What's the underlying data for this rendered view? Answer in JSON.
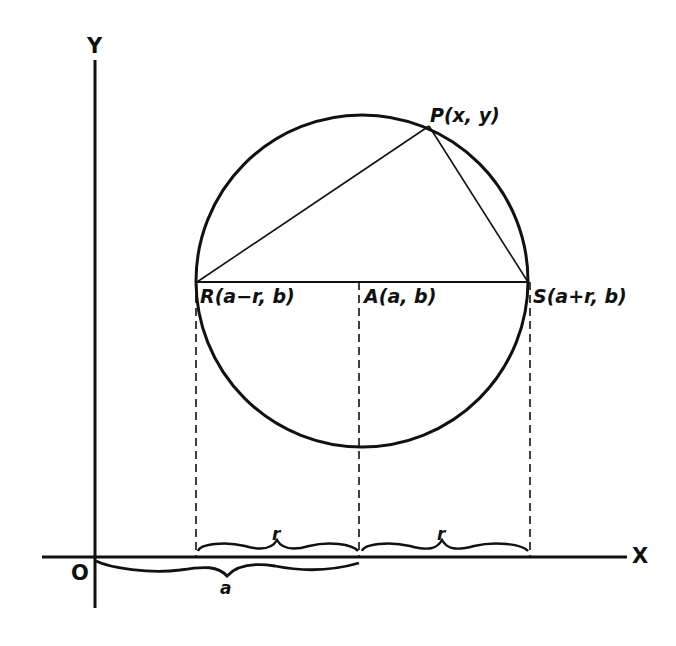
{
  "diagram": {
    "axes": {
      "x_label": "X",
      "y_label": "Y",
      "origin_label": "O"
    },
    "points": {
      "P": {
        "label": "P(x, y)"
      },
      "R": {
        "label": "R(a−r, b)"
      },
      "A": {
        "label": "A(a, b)"
      },
      "S": {
        "label": "S(a+r, b)"
      }
    },
    "braces": {
      "r_left": "r",
      "r_right": "r",
      "a": "a"
    },
    "colors": {
      "ink": "#111111",
      "background": "#ffffff"
    }
  }
}
